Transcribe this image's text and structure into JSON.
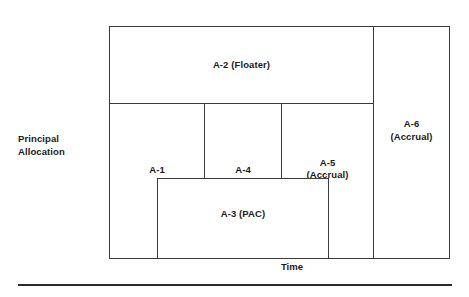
{
  "figure": {
    "title": "",
    "axes": {
      "y_label_lines": [
        "Principal",
        "Allocation"
      ],
      "y_label": "Principal Allocation",
      "x_label": "Time"
    },
    "style": {
      "background": "#ffffff",
      "line_color": "#3a3a3a",
      "text_color": "#1a1a1a",
      "rule_color": "#2b2b2b"
    },
    "blocks": [
      {
        "id": "A-2",
        "label": "A-2 (Floater)",
        "name": "A-2",
        "type": "Floater"
      },
      {
        "id": "A-1",
        "label": "A-1",
        "name": "A-1",
        "type": ""
      },
      {
        "id": "A-4",
        "label": "A-4",
        "name": "A-4",
        "type": ""
      },
      {
        "id": "A-5",
        "label": "A-5\n(Accrual)",
        "name": "A-5",
        "type": "Accrual"
      },
      {
        "id": "A-6",
        "label": "A-6\n(Accrual)",
        "name": "A-6",
        "type": "Accrual"
      },
      {
        "id": "A-3",
        "label": "A-3 (PAC)",
        "name": "A-3",
        "type": "PAC"
      }
    ]
  },
  "chart_data": {
    "type": "area",
    "title": "",
    "xlabel": "Time",
    "ylabel": "Principal Allocation",
    "grid": false,
    "legend": "none",
    "note": "Stacked principal-allocation schematic: each rectangle is a CMO tranche occupying a span of time (x) and a share of principal allocation (y).",
    "xlim": [
      0,
      100
    ],
    "ylim": [
      0,
      100
    ],
    "regions": [
      {
        "label": "A-2 (Floater)",
        "x0": 0,
        "x1": 77.8,
        "y0": 66.4,
        "y1": 100.0
      },
      {
        "label": "A-1",
        "x0": 0,
        "x1": 28.2,
        "y0": 0.0,
        "y1": 66.4
      },
      {
        "label": "A-4",
        "x0": 28.2,
        "x1": 50.7,
        "y0": 0.0,
        "y1": 66.4
      },
      {
        "label": "A-5 (Accrual)",
        "x0": 50.7,
        "x1": 77.8,
        "y0": 0.0,
        "y1": 66.4
      },
      {
        "label": "A-6 (Accrual)",
        "x0": 77.5,
        "x1": 100.0,
        "y0": 0.0,
        "y1": 100.0
      },
      {
        "label": "A-3 (PAC)",
        "x0": 14.1,
        "x1": 64.4,
        "y0": 0.0,
        "y1": 34.8
      }
    ]
  }
}
